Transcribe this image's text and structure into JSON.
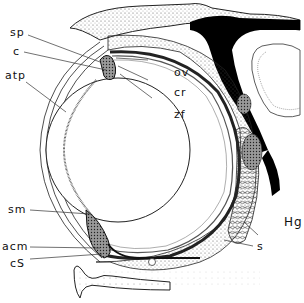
{
  "figure": {
    "labels": [
      {
        "id": "sp",
        "text": "sp"
      },
      {
        "id": "c",
        "text": "c"
      },
      {
        "id": "atp",
        "text": "atp"
      },
      {
        "id": "ov",
        "text": "ov"
      },
      {
        "id": "cr",
        "text": "cr"
      },
      {
        "id": "zf",
        "text": "zf"
      },
      {
        "id": "sm",
        "text": "sm"
      },
      {
        "id": "acm",
        "text": "acm"
      },
      {
        "id": "cS",
        "text": "cS"
      },
      {
        "id": "Hg",
        "text": "Hg"
      },
      {
        "id": "s",
        "text": "s"
      }
    ]
  }
}
